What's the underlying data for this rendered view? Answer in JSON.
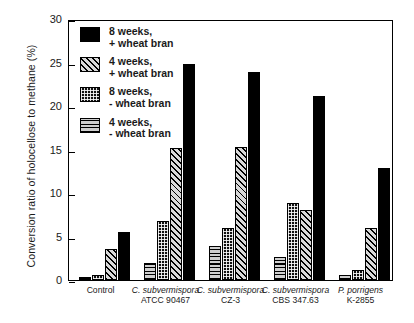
{
  "chart_data": {
    "type": "bar",
    "title": "",
    "xlabel": "",
    "ylabel": "Conversion ratio of holocellose to methane  (%)",
    "ylim": [
      0,
      30
    ],
    "yticks": [
      0,
      5,
      10,
      15,
      20,
      25,
      30
    ],
    "grid": false,
    "legend_position": "upper-left-inside",
    "categories": [
      "Control",
      "C. subvermispora ATCC 90467",
      "C. subvermispora CZ-3",
      "C. subvermispora CBS 347.63",
      "P. porrigens K-2855"
    ],
    "category_lines": [
      {
        "line1": "Control",
        "line2": "",
        "italic": false
      },
      {
        "line1": "C. subvermispora",
        "line2": "ATCC 90467",
        "italic": true
      },
      {
        "line1": "C. subvermispora",
        "line2": "CZ-3",
        "italic": true
      },
      {
        "line1": "C. subvermispora",
        "line2": "CBS 347.63",
        "italic": true
      },
      {
        "line1": "P. porrigens",
        "line2": "K-2855",
        "italic": true
      }
    ],
    "series": [
      {
        "name": "4 weeks, - wheat bran",
        "pattern": "horizontal-lines",
        "values": [
          0.3,
          1.9,
          3.9,
          2.6,
          0.6
        ]
      },
      {
        "name": "8 weeks, - wheat bran",
        "pattern": "dotted-dark",
        "values": [
          0.6,
          6.8,
          6.0,
          8.9,
          1.1
        ]
      },
      {
        "name": "4 weeks, + wheat bran",
        "pattern": "diagonal-hatch",
        "values": [
          3.6,
          15.2,
          15.3,
          8.1,
          6.0
        ]
      },
      {
        "name": "8 weeks, + wheat bran",
        "pattern": "solid-black",
        "values": [
          5.5,
          24.8,
          23.9,
          21.2,
          12.9
        ]
      }
    ]
  },
  "legend": {
    "items": [
      {
        "swatch": "solid-black",
        "line1": "8 weeks,",
        "line2": "+ wheat bran"
      },
      {
        "swatch": "diagonal-hatch",
        "line1": "4 weeks,",
        "line2": "+ wheat bran"
      },
      {
        "swatch": "dotted-dark",
        "line1": "8 weeks,",
        "line2": "- wheat bran"
      },
      {
        "swatch": "horizontal-lines",
        "line1": "4 weeks,",
        "line2": "- wheat bran"
      }
    ]
  },
  "colors": {
    "axis": "#000000",
    "background": "#ffffff",
    "bar_solid": "#000000",
    "bar_hatch_bg": "#d8d8d8",
    "bar_horiz_bg": "#cfcfcf"
  }
}
